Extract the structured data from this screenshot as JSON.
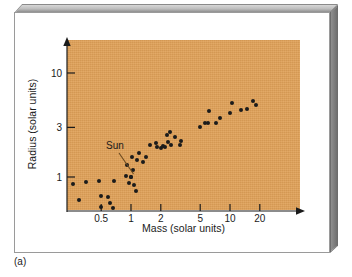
{
  "figure": {
    "panel_letter": "(a)",
    "plot_background_color": "#e0a158",
    "point_color": "#1b1b1b",
    "card_background_color": "#ffffff",
    "bevel_color": "#8e8e8e"
  },
  "annotations": {
    "sun_label": "Sun"
  },
  "chart_data": {
    "type": "scatter",
    "title": "",
    "xlabel": "Mass (solar units)",
    "ylabel": "Radius (solar units)",
    "xscale": "log",
    "yscale": "log",
    "grid": false,
    "legend": null,
    "xlim": [
      0.2,
      40
    ],
    "ylim": [
      0.35,
      18
    ],
    "xticks": [
      0.5,
      1,
      2,
      5,
      10,
      20
    ],
    "xtick_labels": [
      "0.5",
      "1",
      "2",
      "5",
      "10",
      "20"
    ],
    "yticks": [
      1,
      3,
      10
    ],
    "ytick_labels": [
      "1",
      "3",
      "10"
    ],
    "series": [
      {
        "name": "Main-sequence stars",
        "x_label": "mass",
        "y_label": "radius",
        "points": [
          [
            0.26,
            0.86
          ],
          [
            0.35,
            0.9
          ],
          [
            0.3,
            0.6
          ],
          [
            0.48,
            0.92
          ],
          [
            0.5,
            0.66
          ],
          [
            0.5,
            0.52
          ],
          [
            0.58,
            0.64
          ],
          [
            0.62,
            0.56
          ],
          [
            0.68,
            0.92
          ],
          [
            0.66,
            0.5
          ],
          [
            0.88,
            1.02
          ],
          [
            0.92,
            1.3
          ],
          [
            0.95,
            0.88
          ],
          [
            1.0,
            1.0
          ],
          [
            1.02,
            1.55
          ],
          [
            1.05,
            1.18
          ],
          [
            1.08,
            0.84
          ],
          [
            1.12,
            0.74
          ],
          [
            1.15,
            1.45
          ],
          [
            1.2,
            1.72
          ],
          [
            1.32,
            1.38
          ],
          [
            1.42,
            1.55
          ],
          [
            1.55,
            2.05
          ],
          [
            1.8,
            2.12
          ],
          [
            1.85,
            1.95
          ],
          [
            2.0,
            1.9
          ],
          [
            2.1,
            2.0
          ],
          [
            2.2,
            1.95
          ],
          [
            2.3,
            2.55
          ],
          [
            2.35,
            2.15
          ],
          [
            2.5,
            2.7
          ],
          [
            2.55,
            2.05
          ],
          [
            2.8,
            2.4
          ],
          [
            3.1,
            2.05
          ],
          [
            3.2,
            2.2
          ],
          [
            5.0,
            3.05
          ],
          [
            5.6,
            3.3
          ],
          [
            6.0,
            3.3
          ],
          [
            6.2,
            4.3
          ],
          [
            7.2,
            3.3
          ],
          [
            8.0,
            3.7
          ],
          [
            10.0,
            4.1
          ],
          [
            10.4,
            5.2
          ],
          [
            13.0,
            4.4
          ],
          [
            15.0,
            4.5
          ],
          [
            17.0,
            5.4
          ],
          [
            18.5,
            4.9
          ]
        ]
      },
      {
        "name": "Sun",
        "x_label": "mass",
        "y_label": "radius",
        "points": [
          [
            1.0,
            1.0
          ]
        ]
      }
    ]
  }
}
